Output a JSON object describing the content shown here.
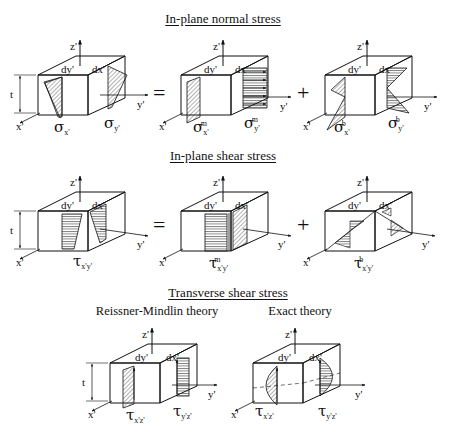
{
  "sections": [
    {
      "title": "In-plane normal stress",
      "panels": [
        {
          "stress_symbol": "σ",
          "labels": {
            "x_axis": "x'",
            "y_axis": "y'",
            "z_axis": "z'",
            "dy": "dy'",
            "dx": "dx'",
            "thickness": "t"
          },
          "left_stress": {
            "sym": "σ",
            "sub": "x'",
            "sup": ""
          },
          "right_stress": {
            "sym": "σ",
            "sub": "y'",
            "sup": ""
          },
          "distribution": "linear-trapezoid"
        },
        {
          "operator": "=",
          "labels": {
            "x_axis": "x'",
            "y_axis": "y'",
            "z_axis": "z'",
            "dy": "dy'",
            "dx": "dx'"
          },
          "left_stress": {
            "sym": "σ",
            "sub": "x'",
            "sup": "m"
          },
          "right_stress": {
            "sym": "σ",
            "sub": "y'",
            "sup": "m"
          },
          "distribution": "uniform"
        },
        {
          "operator": "+",
          "labels": {
            "x_axis": "x'",
            "y_axis": "y'",
            "z_axis": "z'",
            "dy": "dy'",
            "dx": "dx'"
          },
          "left_stress": {
            "sym": "σ",
            "sub": "x'",
            "sup": "b"
          },
          "right_stress": {
            "sym": "σ",
            "sub": "y'",
            "sup": "b"
          },
          "distribution": "linear-bending"
        }
      ]
    },
    {
      "title": "In-plane shear stress",
      "panels": [
        {
          "labels": {
            "x_axis": "x'",
            "y_axis": "y'",
            "z_axis": "z'",
            "dy": "dy'",
            "dx": "dx'",
            "thickness": "t"
          },
          "stress": {
            "sym": "τ",
            "sub": "x'y'",
            "sup": ""
          },
          "distribution": "linear-trapezoid"
        },
        {
          "operator": "=",
          "labels": {
            "x_axis": "x'",
            "y_axis": "y'",
            "z_axis": "z'",
            "dy": "dy'",
            "dx": "dx'"
          },
          "stress": {
            "sym": "τ",
            "sub": "x'y'",
            "sup": "m"
          },
          "distribution": "uniform"
        },
        {
          "operator": "+",
          "labels": {
            "x_axis": "x'",
            "y_axis": "y'",
            "z_axis": "z'",
            "dy": "dy'",
            "dx": "dx'"
          },
          "stress": {
            "sym": "τ",
            "sub": "x'y'",
            "sup": "b"
          },
          "distribution": "linear-bending"
        }
      ]
    },
    {
      "title": "Transverse shear stress",
      "panels": [
        {
          "subtitle": "Reissner-Mindlin theory",
          "labels": {
            "x_axis": "x'",
            "y_axis": "y'",
            "z_axis": "z'",
            "dy": "dy'",
            "dx": "dx'",
            "thickness": "t"
          },
          "left_stress": {
            "sym": "τ",
            "sub": "x'z'",
            "sup": ""
          },
          "right_stress": {
            "sym": "τ",
            "sub": "y'z'",
            "sup": ""
          },
          "distribution": "constant"
        },
        {
          "subtitle": "Exact theory",
          "labels": {
            "x_axis": "x'",
            "y_axis": "y'",
            "z_axis": "z'",
            "dy": "dy'",
            "dx": "dx'"
          },
          "left_stress": {
            "sym": "τ",
            "sub": "x'z'",
            "sup": ""
          },
          "right_stress": {
            "sym": "τ",
            "sub": "y'z'",
            "sup": ""
          },
          "distribution": "parabolic"
        }
      ]
    }
  ]
}
